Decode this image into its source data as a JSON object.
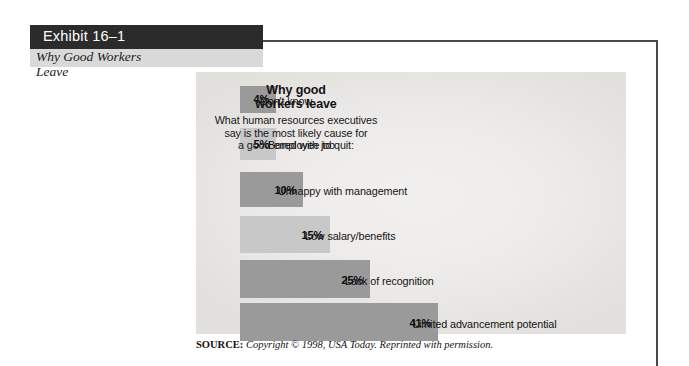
{
  "exhibit": {
    "header_label": "Exhibit 16–1",
    "subtitle_line1": "Why Good Workers",
    "subtitle_line2": "Leave"
  },
  "chart_header": {
    "title_line1": "Why good",
    "title_line2": "workers leave",
    "subtitle_line1": "What human resources executives",
    "subtitle_line2": "say is the most likely cause for",
    "subtitle_line3": "a good employee to quit:"
  },
  "source": {
    "key": "SOURCE:",
    "body": "Copyright © 1998, USA Today. Reprinted with permission."
  },
  "colors": {
    "bar_dark": "#9a9a9a",
    "bar_light": "#c8c8c8",
    "header_bar": "#2b2b2b",
    "header_text": "#ffffff",
    "subtitle_band": "#d9d9d9",
    "frame_line": "#4a4a4a",
    "figure_bg": "#efedeb"
  },
  "chart_data": {
    "type": "bar",
    "orientation": "horizontal",
    "title": "Why good workers leave",
    "subtitle": "What human resources executives say is the most likely cause for a good employee to quit:",
    "xlabel": "",
    "ylabel": "",
    "xlim": [
      0,
      41
    ],
    "grid": false,
    "legend": false,
    "units": "percent",
    "source": "Copyright © 1998, USA Today. Reprinted with permission.",
    "categories": [
      "Don't know",
      "Bored with job",
      "Unhappy with management",
      "Low salary/benefits",
      "Lack of recognition",
      "Limited advancement potential"
    ],
    "values": [
      4,
      5,
      10,
      15,
      25,
      41
    ],
    "value_labels": [
      "4%",
      "5%",
      "10%",
      "15%",
      "25%",
      "41%"
    ],
    "bars": [
      {
        "label": "Don't know",
        "value": 4,
        "value_label": "4%",
        "shade": "dark",
        "color": "#9a9a9a",
        "x": 240,
        "y": 14,
        "w": 36,
        "h": 27,
        "value_top": 7,
        "label_top": 9,
        "label_left": 56
      },
      {
        "label": "Bored with job",
        "value": 5,
        "value_label": "5%",
        "shade": "light",
        "color": "#c8c8c8",
        "x": 240,
        "y": 56,
        "w": 36,
        "h": 32,
        "value_top": 10,
        "label_top": 11,
        "label_left": 64
      },
      {
        "label": "Unhappy with management",
        "value": 10,
        "value_label": "10%",
        "shade": "dark",
        "color": "#9a9a9a",
        "x": 240,
        "y": 100,
        "w": 63,
        "h": 35,
        "value_top": 12,
        "label_top": 13,
        "label_left": 74
      },
      {
        "label": "Low salary/benefits",
        "value": 15,
        "value_label": "15%",
        "shade": "light",
        "color": "#c8c8c8",
        "x": 240,
        "y": 144,
        "w": 90,
        "h": 37,
        "value_top": 13,
        "label_top": 14,
        "label_left": 101
      },
      {
        "label": "Lack of recognition",
        "value": 25,
        "value_label": "25%",
        "shade": "dark",
        "color": "#9a9a9a",
        "x": 240,
        "y": 188,
        "w": 130,
        "h": 38,
        "value_top": 14,
        "label_top": 15,
        "label_left": 141
      },
      {
        "label": "Limited advancement potential",
        "value": 41,
        "value_label": "41%",
        "shade": "dark",
        "color": "#9a9a9a",
        "x": 240,
        "y": 231,
        "w": 198,
        "h": 38,
        "value_top": 14,
        "label_top": 15,
        "label_left": 209
      }
    ]
  }
}
